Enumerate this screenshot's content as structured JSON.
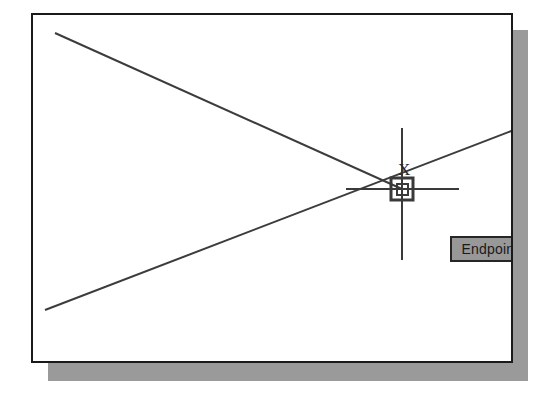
{
  "application": {
    "name": "CAD Drawing Window",
    "object_snap_mode": "Endpoint"
  },
  "tooltip": {
    "label": "Endpoint",
    "background_color": "#989898",
    "border_color": "#262626",
    "text_color": "#1a1a1a",
    "x": 417,
    "y": 221,
    "width": 80,
    "height": 26
  },
  "cursor": {
    "crosshair_center_x": 400,
    "crosshair_center_y": 187,
    "vertical_top_y": 126,
    "vertical_bottom_y": 258,
    "horizontal_left_x": 344,
    "horizontal_right_x": 457,
    "color": "#3a3a3a",
    "pick_box_size": 22,
    "inner_box_size": 11,
    "snap_marker_name": "endpoint-square-marker",
    "x_glyph": "X",
    "x_glyph_x": 365,
    "x_glyph_y": 146
  },
  "frame": {
    "x": 31,
    "y": 13,
    "width": 482,
    "height": 350,
    "border_color": "#1a1a1a",
    "background_color": "#ffffff",
    "shadow_color": "#9a9a9a",
    "shadow_offset_x": 17,
    "shadow_offset_y": 17
  },
  "geometry": {
    "line_color": "#3c3c3c",
    "lines": [
      {
        "name": "descending-line",
        "x1": 22,
        "y1": 18,
        "x2": 369,
        "y2": 174
      },
      {
        "name": "ascending-line",
        "x1": 12,
        "y1": 295,
        "x2": 481,
        "y2": 115
      }
    ]
  }
}
